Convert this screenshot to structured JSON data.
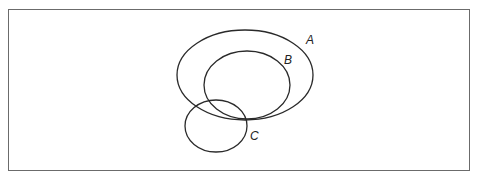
{
  "diagram": {
    "type": "venn-euler",
    "frame": {
      "stroke": "#6b6b6b"
    },
    "sets": [
      {
        "id": "A",
        "label": "A",
        "cx": 245,
        "cy": 75,
        "rx": 68,
        "ry": 45,
        "label_x": 306,
        "label_y": 44
      },
      {
        "id": "B",
        "label": "B",
        "cx": 247,
        "cy": 85,
        "rx": 43,
        "ry": 34,
        "label_x": 284,
        "label_y": 64
      },
      {
        "id": "C",
        "label": "C",
        "cx": 216,
        "cy": 126,
        "rx": 31,
        "ry": 26,
        "label_x": 250,
        "label_y": 140
      }
    ],
    "relations": "B is a subset of A; C partially overlaps A and B"
  }
}
